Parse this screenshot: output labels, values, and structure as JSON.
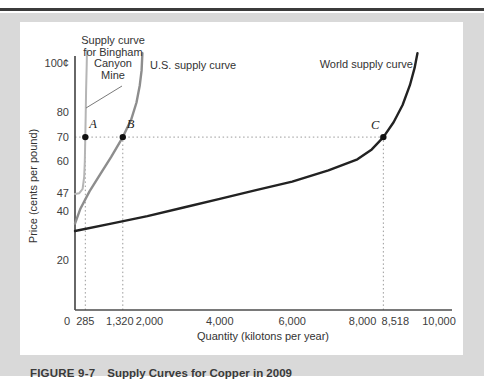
{
  "caption": {
    "figure_label": "FIGURE 9-7",
    "title": "Supply Curves for Copper in 2009"
  },
  "colors": {
    "page_background": "#d9d9d9",
    "panel": "#ffffff",
    "top_rule": "#3b3b3b",
    "axis": "#4d4d4d",
    "guide_dotted": "#9a9a9a",
    "tick_text": "#3d3d3d",
    "label_text": "#333333",
    "bingham_curve": "#b5b5b5",
    "us_curve": "#8d8d8d",
    "world_curve": "#222222",
    "point_dot": "#111111",
    "pointer_line": "#7a7a7a"
  },
  "chart_data": {
    "type": "line",
    "title": "",
    "xlabel": "Quantity (kilotons per year)",
    "ylabel": "Price (cents per pound)",
    "xlim": [
      0,
      10400
    ],
    "ylim": [
      0,
      106
    ],
    "grid": "off",
    "x_ticks": [
      {
        "value": 0,
        "label": "0",
        "dx": -8
      },
      {
        "value": 285,
        "label": "285",
        "dx": 0
      },
      {
        "value": 1320,
        "label": "1,320",
        "dx": -3
      },
      {
        "value": 2000,
        "label": "2,000",
        "dx": 2
      },
      {
        "value": 4000,
        "label": "4,000",
        "dx": 0
      },
      {
        "value": 6000,
        "label": "6,000",
        "dx": 0
      },
      {
        "value": 8000,
        "label": "8,000",
        "dx": -2
      },
      {
        "value": 8518,
        "label": "8,518",
        "dx": 12
      },
      {
        "value": 10000,
        "label": "10,000",
        "dx": 2
      }
    ],
    "y_ticks": [
      {
        "value": 100,
        "label": "100¢"
      },
      {
        "value": 80,
        "label": "80"
      },
      {
        "value": 70,
        "label": "70"
      },
      {
        "value": 60,
        "label": "60"
      },
      {
        "value": 47,
        "label": "47"
      },
      {
        "value": 40,
        "label": "40"
      },
      {
        "value": 20,
        "label": "20"
      }
    ],
    "series": [
      {
        "name": "Supply curve for Bingham Canyon Mine",
        "color": "#b5b5b5",
        "width": 2,
        "points": [
          [
            0,
            47
          ],
          [
            120,
            47.3
          ],
          [
            210,
            49
          ],
          [
            255,
            54
          ],
          [
            272,
            60
          ],
          [
            285,
            70
          ],
          [
            295,
            79
          ],
          [
            308,
            89
          ],
          [
            322,
            99
          ],
          [
            332,
            105
          ]
        ]
      },
      {
        "name": "U.S. supply curve",
        "color": "#8d8d8d",
        "width": 2.4,
        "points": [
          [
            0,
            35
          ],
          [
            150,
            41
          ],
          [
            400,
            48
          ],
          [
            700,
            55
          ],
          [
            1000,
            62
          ],
          [
            1320,
            70
          ],
          [
            1550,
            77
          ],
          [
            1700,
            84
          ],
          [
            1790,
            91
          ],
          [
            1840,
            97
          ],
          [
            1862,
            104
          ]
        ]
      },
      {
        "name": "World supply curve",
        "color": "#222222",
        "width": 2.4,
        "points": [
          [
            0,
            32
          ],
          [
            1000,
            35
          ],
          [
            2000,
            38
          ],
          [
            3000,
            41.5
          ],
          [
            4000,
            45
          ],
          [
            5000,
            48.5
          ],
          [
            6000,
            52
          ],
          [
            7000,
            56.5
          ],
          [
            7800,
            61
          ],
          [
            8200,
            65
          ],
          [
            8518,
            70
          ],
          [
            8800,
            76
          ],
          [
            9050,
            83
          ],
          [
            9250,
            91
          ],
          [
            9380,
            98
          ],
          [
            9460,
            104
          ]
        ]
      }
    ],
    "key_points": [
      {
        "name": "A",
        "q": 285,
        "price": 70
      },
      {
        "name": "B",
        "q": 1320,
        "price": 70
      },
      {
        "name": "C",
        "q": 8518,
        "price": 70
      }
    ],
    "guides": {
      "horizontal": [
        {
          "price": 70,
          "from_q": 0,
          "to_q": 8518
        }
      ],
      "vertical": [
        {
          "q": 285,
          "to_price": 70
        },
        {
          "q": 1320,
          "to_price": 70
        },
        {
          "q": 8518,
          "to_price": 70
        }
      ]
    },
    "annotations": {
      "bingham_label_lines": [
        "Supply curve",
        "for Bingham",
        "Canyon",
        "Mine"
      ],
      "us_label": "U.S. supply curve",
      "world_label": "World supply curve"
    }
  }
}
